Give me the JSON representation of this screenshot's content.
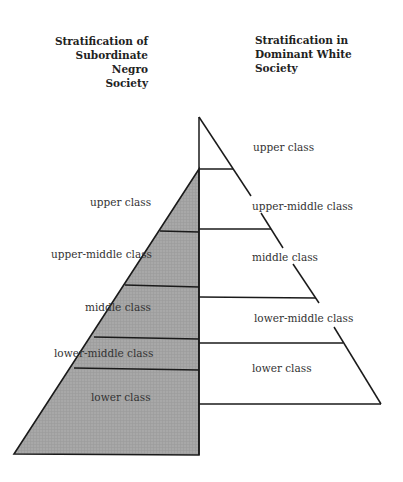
{
  "headings": {
    "left": [
      "Stratification of",
      "Subordinate Negro",
      "Society"
    ],
    "right": [
      "Stratification in",
      "Dominant White",
      "Society"
    ]
  },
  "left_pyramid": {
    "fill": "#a9a9a9",
    "classes": [
      {
        "label": "upper class"
      },
      {
        "label": "upper-middle class"
      },
      {
        "label": "middle class"
      },
      {
        "label": "lower-middle class"
      },
      {
        "label": "lower class"
      }
    ]
  },
  "right_pyramid": {
    "fill": "#ffffff",
    "classes": [
      {
        "label": "upper class"
      },
      {
        "label": "upper-middle class"
      },
      {
        "label": "middle class"
      },
      {
        "label": "lower-middle class"
      },
      {
        "label": "lower class"
      }
    ]
  }
}
